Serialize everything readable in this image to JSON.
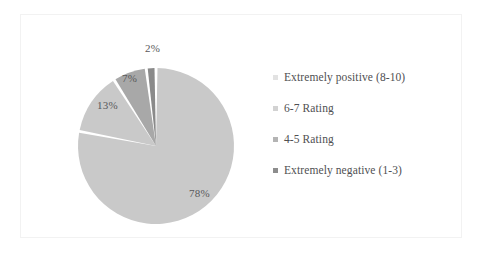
{
  "chart_data": {
    "type": "pie",
    "title": "",
    "subtitle": "",
    "xlabel": "",
    "ylabel": "",
    "legend_position": "right",
    "grid": false,
    "start_angle_deg": 0,
    "direction": "clockwise",
    "categories": [
      "Extremely positive (8-10)",
      "6-7 Rating",
      "4-5 Rating",
      "Extremely negative (1-3)"
    ],
    "values": [
      78,
      13,
      7,
      2
    ],
    "value_labels": [
      "78%",
      "13%",
      "7%",
      "2%"
    ],
    "colors": [
      "#c9c9c9",
      "#c9c9c9",
      "#a8a8a8",
      "#8a8a8a"
    ],
    "slices": [
      {
        "label": "Extremely positive (8-10)",
        "value": 78,
        "display": "78%",
        "color": "#c9c9c9"
      },
      {
        "label": "6-7 Rating",
        "value": 13,
        "display": "13%",
        "color": "#c9c9c9"
      },
      {
        "label": "4-5 Rating",
        "value": 7,
        "display": "7%",
        "color": "#a8a8a8"
      },
      {
        "label": "Extremely negative (1-3)",
        "value": 2,
        "display": "2%",
        "color": "#8a8a8a"
      }
    ]
  },
  "legend": {
    "items": [
      {
        "label": "Extremely positive (8-10)",
        "marker_color": "#e2e2e2"
      },
      {
        "label": "6-7 Rating",
        "marker_color": "#d2d2d2"
      },
      {
        "label": "4-5 Rating",
        "marker_color": "#b4b4b4"
      },
      {
        "label": "Extremely negative (1-3)",
        "marker_color": "#8d8d8d"
      }
    ]
  },
  "frame": {
    "border_color": "#f2f2f2",
    "background": "#ffffff"
  }
}
